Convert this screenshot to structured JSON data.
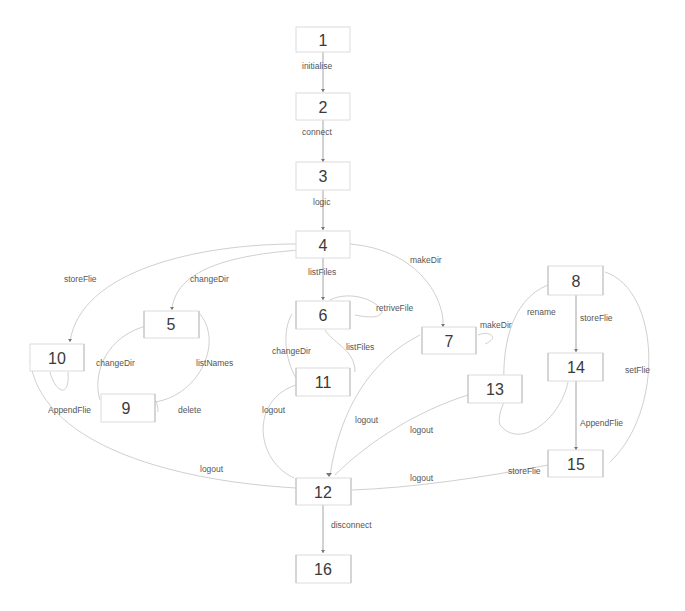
{
  "diagram": {
    "type": "state-transition-diagram",
    "colors": {
      "node_border": "#dcdcdc",
      "edge": "#c9c9c9",
      "text": "#3a3a3a",
      "label": "#555555"
    },
    "nodes": [
      {
        "id": "1",
        "label": "1"
      },
      {
        "id": "2",
        "label": "2"
      },
      {
        "id": "3",
        "label": "3"
      },
      {
        "id": "4",
        "label": "4"
      },
      {
        "id": "5",
        "label": "5"
      },
      {
        "id": "6",
        "label": "6"
      },
      {
        "id": "7",
        "label": "7"
      },
      {
        "id": "8",
        "label": "8"
      },
      {
        "id": "9",
        "label": "9"
      },
      {
        "id": "10",
        "label": "10"
      },
      {
        "id": "11",
        "label": "11"
      },
      {
        "id": "12",
        "label": "12"
      },
      {
        "id": "13",
        "label": "13"
      },
      {
        "id": "14",
        "label": "14"
      },
      {
        "id": "15",
        "label": "15"
      },
      {
        "id": "16",
        "label": "16"
      }
    ],
    "edges": [
      {
        "from": "1",
        "to": "2",
        "label": "initialise"
      },
      {
        "from": "2",
        "to": "3",
        "label": "connect"
      },
      {
        "from": "3",
        "to": "4",
        "label": "logic"
      },
      {
        "from": "4",
        "to": "10",
        "label": "storeFlie"
      },
      {
        "from": "4",
        "to": "5",
        "label": "changeDir"
      },
      {
        "from": "4",
        "to": "6",
        "label": "listFiles"
      },
      {
        "from": "4",
        "to": "7",
        "label": "makeDir"
      },
      {
        "from": "6",
        "to": "6",
        "label": "retriveFile"
      },
      {
        "from": "6",
        "to": "11",
        "label": "listFiles"
      },
      {
        "from": "11",
        "to": "6",
        "label": "changeDir"
      },
      {
        "from": "7",
        "to": "7",
        "label": "makeDir"
      },
      {
        "from": "5",
        "to": "9",
        "label": "changeDir"
      },
      {
        "from": "5",
        "to": "9",
        "label": "listNames"
      },
      {
        "from": "10",
        "to": "10",
        "label": "AppendFlie"
      },
      {
        "from": "9",
        "to": "9",
        "label": "delete"
      },
      {
        "from": "9",
        "to": "12",
        "label": "logout"
      },
      {
        "from": "11",
        "to": "12",
        "label": "logout"
      },
      {
        "from": "7",
        "to": "12",
        "label": "logout"
      },
      {
        "from": "13",
        "to": "12",
        "label": "logout"
      },
      {
        "from": "15",
        "to": "12",
        "label": "logout"
      },
      {
        "from": "8",
        "to": "13",
        "label": "rename"
      },
      {
        "from": "8",
        "to": "14",
        "label": "storeFlie"
      },
      {
        "from": "8",
        "to": "15",
        "label": "setFlie"
      },
      {
        "from": "14",
        "to": "15",
        "label": "AppendFlie"
      },
      {
        "from": "14",
        "to": "15",
        "label": "storeFlie"
      },
      {
        "from": "12",
        "to": "16",
        "label": "disconnect"
      }
    ]
  }
}
